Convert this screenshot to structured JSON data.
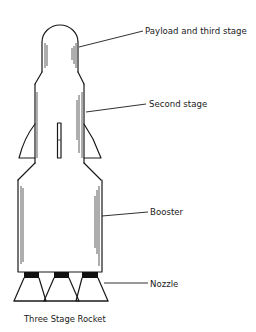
{
  "diagram": {
    "title": "Three Stage Rocket",
    "labels": {
      "payload": "Payload and third stage",
      "second_stage": "Second stage",
      "booster": "Booster",
      "nozzle": "Nozzle"
    },
    "parts": [
      {
        "id": "payload",
        "name": "Payload and third stage"
      },
      {
        "id": "second_stage",
        "name": "Second stage"
      },
      {
        "id": "booster",
        "name": "Booster"
      },
      {
        "id": "nozzle",
        "name": "Nozzle",
        "count": 3
      }
    ],
    "colors": {
      "line": "#1a1a1a",
      "background": "#ffffff",
      "nozzle_throat": "#111111"
    }
  }
}
